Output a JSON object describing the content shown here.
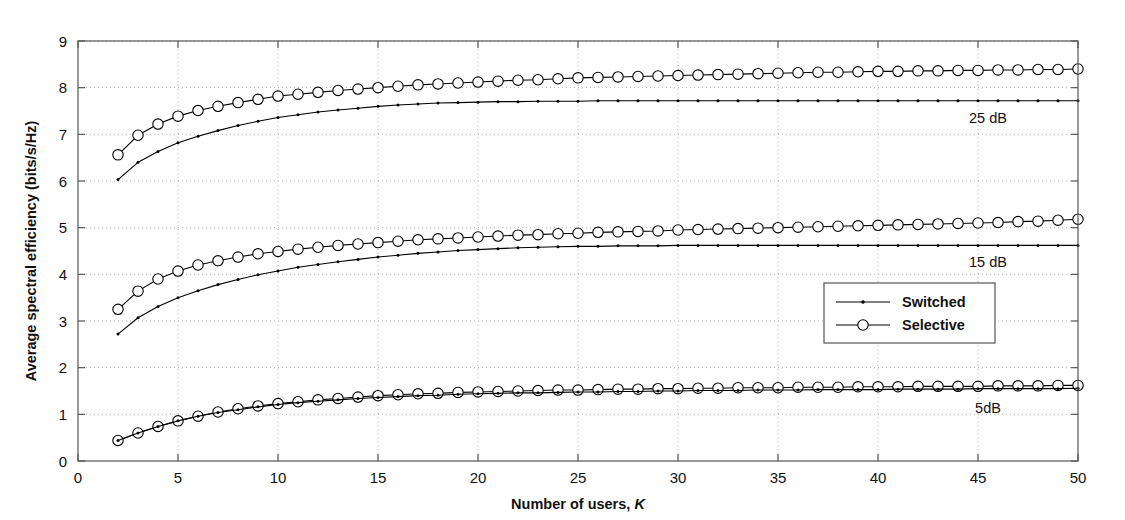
{
  "figure": {
    "background_color": "#ffffff",
    "axes_color": "#555555",
    "grid_color": "#b5b5b5",
    "line_color": "#000000"
  },
  "axes": {
    "x": {
      "label_main": "Number of users,",
      "label_italic": "K",
      "ticks": [
        0,
        5,
        10,
        15,
        20,
        25,
        30,
        35,
        40,
        45,
        50
      ],
      "min": 0,
      "max": 50
    },
    "y": {
      "label": "Average spectral efficiency (bits/s/Hz)",
      "ticks": [
        0,
        1,
        2,
        3,
        4,
        5,
        6,
        7,
        8,
        9
      ],
      "min": 0,
      "max": 9
    }
  },
  "legend": {
    "entries": [
      {
        "label": "Switched",
        "marker": "dot"
      },
      {
        "label": "Selective",
        "marker": "circle"
      }
    ]
  },
  "annotations": [
    {
      "text": "25 dB",
      "x": 45.5,
      "y": 7.25
    },
    {
      "text": "15 dB",
      "x": 45.5,
      "y": 4.15
    },
    {
      "text": "5dB",
      "x": 45.5,
      "y": 1.03
    }
  ],
  "chart_data": {
    "type": "line",
    "title": "",
    "xlabel": "Number of users, K",
    "ylabel": "Average spectral efficiency (bits/s/Hz)",
    "xlim": [
      0,
      50
    ],
    "ylim": [
      0,
      9
    ],
    "grid": true,
    "legend_position": "center-right",
    "x": [
      2,
      3,
      4,
      5,
      6,
      7,
      8,
      9,
      10,
      11,
      12,
      13,
      14,
      15,
      16,
      17,
      18,
      19,
      20,
      21,
      22,
      23,
      24,
      25,
      26,
      27,
      28,
      29,
      30,
      31,
      32,
      33,
      34,
      35,
      36,
      37,
      38,
      39,
      40,
      41,
      42,
      43,
      44,
      45,
      46,
      47,
      48,
      49,
      50
    ],
    "series": [
      {
        "name": "Selective 25 dB",
        "group": "25 dB",
        "marker": "circle",
        "values": [
          6.56,
          6.98,
          7.22,
          7.39,
          7.51,
          7.6,
          7.68,
          7.75,
          7.82,
          7.86,
          7.9,
          7.94,
          7.97,
          8.0,
          8.03,
          8.06,
          8.08,
          8.1,
          8.12,
          8.14,
          8.16,
          8.17,
          8.19,
          8.21,
          8.22,
          8.23,
          8.24,
          8.25,
          8.26,
          8.27,
          8.28,
          8.29,
          8.3,
          8.31,
          8.32,
          8.33,
          8.33,
          8.34,
          8.35,
          8.35,
          8.36,
          8.36,
          8.37,
          8.37,
          8.38,
          8.38,
          8.39,
          8.39,
          8.4
        ]
      },
      {
        "name": "Switched 25 dB",
        "group": "25 dB",
        "marker": "dot",
        "values": [
          6.03,
          6.4,
          6.63,
          6.82,
          6.96,
          7.08,
          7.19,
          7.28,
          7.36,
          7.42,
          7.48,
          7.52,
          7.56,
          7.6,
          7.63,
          7.65,
          7.67,
          7.68,
          7.69,
          7.7,
          7.7,
          7.71,
          7.71,
          7.71,
          7.72,
          7.72,
          7.72,
          7.72,
          7.72,
          7.72,
          7.72,
          7.72,
          7.72,
          7.72,
          7.72,
          7.72,
          7.72,
          7.72,
          7.72,
          7.72,
          7.72,
          7.72,
          7.72,
          7.72,
          7.72,
          7.72,
          7.72,
          7.72,
          7.72
        ]
      },
      {
        "name": "Selective 15 dB",
        "group": "15 dB",
        "marker": "circle",
        "values": [
          3.25,
          3.64,
          3.9,
          4.07,
          4.2,
          4.29,
          4.37,
          4.44,
          4.49,
          4.54,
          4.58,
          4.62,
          4.65,
          4.68,
          4.71,
          4.74,
          4.76,
          4.78,
          4.8,
          4.82,
          4.84,
          4.85,
          4.87,
          4.88,
          4.9,
          4.91,
          4.92,
          4.93,
          4.95,
          4.96,
          4.97,
          4.98,
          4.99,
          5.0,
          5.01,
          5.02,
          5.03,
          5.04,
          5.05,
          5.06,
          5.07,
          5.08,
          5.09,
          5.1,
          5.11,
          5.13,
          5.14,
          5.16,
          5.18
        ]
      },
      {
        "name": "Switched 15 dB",
        "group": "15 dB",
        "marker": "dot",
        "values": [
          2.72,
          3.07,
          3.31,
          3.5,
          3.65,
          3.78,
          3.89,
          3.99,
          4.07,
          4.15,
          4.21,
          4.27,
          4.32,
          4.37,
          4.41,
          4.45,
          4.48,
          4.51,
          4.53,
          4.55,
          4.57,
          4.58,
          4.59,
          4.6,
          4.6,
          4.61,
          4.61,
          4.61,
          4.62,
          4.62,
          4.62,
          4.62,
          4.62,
          4.62,
          4.62,
          4.62,
          4.62,
          4.62,
          4.62,
          4.62,
          4.62,
          4.62,
          4.62,
          4.62,
          4.62,
          4.62,
          4.62,
          4.62,
          4.62
        ]
      },
      {
        "name": "Selective 5 dB",
        "group": "5dB",
        "marker": "circle",
        "values": [
          0.44,
          0.6,
          0.74,
          0.86,
          0.96,
          1.05,
          1.12,
          1.18,
          1.23,
          1.27,
          1.31,
          1.34,
          1.37,
          1.4,
          1.42,
          1.44,
          1.45,
          1.47,
          1.48,
          1.49,
          1.5,
          1.51,
          1.52,
          1.52,
          1.53,
          1.54,
          1.54,
          1.55,
          1.55,
          1.56,
          1.56,
          1.57,
          1.57,
          1.57,
          1.58,
          1.58,
          1.58,
          1.59,
          1.59,
          1.59,
          1.6,
          1.6,
          1.6,
          1.6,
          1.61,
          1.61,
          1.61,
          1.62,
          1.62
        ]
      },
      {
        "name": "Switched 5 dB",
        "group": "5dB",
        "marker": "dot",
        "values": [
          0.44,
          0.6,
          0.74,
          0.86,
          0.96,
          1.04,
          1.1,
          1.16,
          1.21,
          1.25,
          1.28,
          1.31,
          1.34,
          1.36,
          1.38,
          1.4,
          1.41,
          1.43,
          1.44,
          1.45,
          1.46,
          1.46,
          1.47,
          1.48,
          1.48,
          1.49,
          1.49,
          1.5,
          1.5,
          1.51,
          1.51,
          1.51,
          1.52,
          1.52,
          1.52,
          1.53,
          1.53,
          1.53,
          1.53,
          1.54,
          1.54,
          1.54,
          1.54,
          1.55,
          1.55,
          1.55,
          1.55,
          1.55,
          1.56
        ]
      }
    ]
  }
}
